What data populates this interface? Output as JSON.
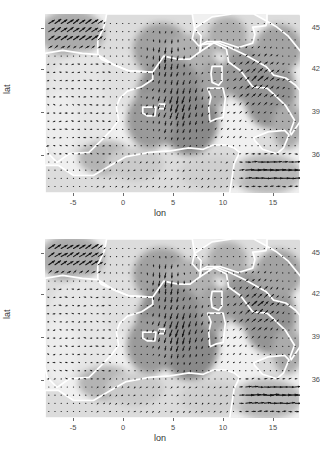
{
  "figure": {
    "background_color": "#ffffff",
    "panel_count": 2,
    "land_color": "#c9c9c9",
    "sea_color": "#f2f2f2",
    "coastline_color": "#ffffff",
    "arrow_color": "#101010"
  },
  "axes": {
    "x_title": "lon",
    "y_title": "lat",
    "x_ticks": [
      "-5",
      "0",
      "5",
      "10",
      "15"
    ],
    "y_ticks": [
      "45",
      "42",
      "39",
      "36"
    ],
    "x_tick_values": [
      -5,
      0,
      5,
      10,
      15
    ],
    "y_tick_values": [
      45,
      42,
      39,
      36
    ],
    "x_range": [
      -6.6,
      16.6
    ],
    "y_range": [
      34.0,
      46.3
    ]
  },
  "panels": [
    {
      "id": "panel-top",
      "name": "upper-vector-field-panel"
    },
    {
      "id": "panel-bottom",
      "name": "lower-vector-field-panel"
    }
  ],
  "chart_data": {
    "type": "scatter",
    "subtype": "quiver-vector-field-map",
    "title": "",
    "xlabel": "lon",
    "ylabel": "lat",
    "xlim": [
      -6.6,
      16.6
    ],
    "ylim": [
      34.0,
      46.3
    ],
    "xticks": [
      -5,
      0,
      5,
      10,
      15
    ],
    "yticks": [
      36,
      39,
      42,
      45
    ],
    "grid": false,
    "legend": "none",
    "panels": 2,
    "grid_spacing_deg": 0.5,
    "vector_regions": [
      {
        "name": "northwest-band",
        "lon_range": [
          -6.3,
          -1.5
        ],
        "lat_range": [
          43.8,
          46.2
        ],
        "direction_deg": 45,
        "magnitude": "medium"
      },
      {
        "name": "iberian-interior",
        "lon_range": [
          -6.3,
          -1.0
        ],
        "lat_range": [
          36.5,
          43.5
        ],
        "direction_deg": 270,
        "magnitude": "weak"
      },
      {
        "name": "central-basin-jet",
        "lon_range": [
          2.5,
          9.0
        ],
        "lat_range": [
          36.5,
          43.5
        ],
        "direction_deg": 270,
        "magnitude": "strong"
      },
      {
        "name": "tyrrhenian-adriatic",
        "lon_range": [
          9.5,
          16.3
        ],
        "lat_range": [
          38.0,
          44.5
        ],
        "direction_deg": 40,
        "magnitude": "strong"
      },
      {
        "name": "southern-eastward-jet",
        "lon_range": [
          11.0,
          16.5
        ],
        "lat_range": [
          34.2,
          36.6
        ],
        "direction_deg": 0,
        "magnitude": "strong"
      },
      {
        "name": "north-african-coast",
        "lon_range": [
          -2.0,
          10.5
        ],
        "lat_range": [
          34.2,
          36.5
        ],
        "direction_deg": 200,
        "magnitude": "weak"
      }
    ]
  }
}
